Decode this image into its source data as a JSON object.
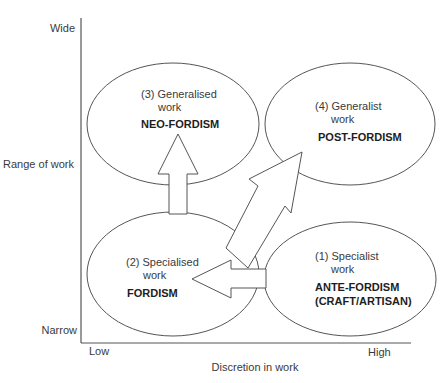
{
  "diagram": {
    "axes": {
      "y_label": "Range of work",
      "y_top": "Wide",
      "y_bottom": "Narrow",
      "x_label": "Discretion in work",
      "x_left": "Low",
      "x_right": "High"
    },
    "quadrants": [
      {
        "id": "q3",
        "title_line1": "(3) Generalised",
        "title_line2": "work",
        "name_line1": "NEO-FORDISM",
        "name_line2": ""
      },
      {
        "id": "q4",
        "title_line1": "(4) Generalist",
        "title_line2": "work",
        "name_line1": "POST-FORDISM",
        "name_line2": ""
      },
      {
        "id": "q2",
        "title_line1": "(2) Specialised",
        "title_line2": "work",
        "name_line1": "FORDISM",
        "name_line2": ""
      },
      {
        "id": "q1",
        "title_line1": "(1) Specialist",
        "title_line2": "work",
        "name_line1": "ANTE-FORDISM",
        "name_line2": "(CRAFT/ARTISAN)"
      }
    ],
    "arrows": [
      {
        "from": "(1) Specialist work",
        "to": "(2) Specialised work",
        "direction": "left"
      },
      {
        "from": "(2) Specialised work",
        "to": "(3) Generalised work",
        "direction": "up"
      },
      {
        "from": "(2) Specialised work",
        "to": "(4) Generalist work",
        "direction": "up-right"
      }
    ]
  }
}
